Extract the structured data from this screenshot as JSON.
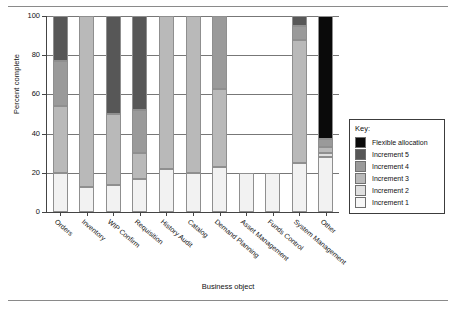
{
  "figure": {
    "rules": [
      "top-rule",
      "bottom-rule"
    ]
  },
  "chart_data": {
    "type": "bar",
    "stacked": true,
    "title": "",
    "xlabel": "Business object",
    "ylabel": "Percent complete",
    "ylim": [
      0,
      100
    ],
    "yticks": [
      0,
      20,
      40,
      60,
      80,
      100
    ],
    "grid": true,
    "legend_position": "right",
    "legend_title": "Key:",
    "categories": [
      "Orders",
      "Inventory",
      "WIP Confirm",
      "Requisition",
      "History Audit",
      "Catalog",
      "Demand Planning",
      "Asset Management",
      "Funds Control",
      "System Management",
      "Other"
    ],
    "series": [
      {
        "name": "Increment 1",
        "color": "#f2f2f2",
        "values": [
          20,
          13,
          14,
          17,
          22,
          20,
          23,
          20,
          20,
          25,
          28
        ]
      },
      {
        "name": "Increment 2",
        "color": "#e0e0e0",
        "values": [
          0,
          0,
          0,
          0,
          0,
          0,
          0,
          0,
          0,
          0,
          2
        ]
      },
      {
        "name": "Increment 3",
        "color": "#b9b9b9",
        "values": [
          34,
          87,
          36,
          13,
          78,
          80,
          40,
          0,
          0,
          63,
          3
        ]
      },
      {
        "name": "Increment 4",
        "color": "#9a9a9a",
        "values": [
          23,
          0,
          0,
          22,
          0,
          0,
          37,
          0,
          0,
          7,
          4
        ]
      },
      {
        "name": "Increment 5",
        "color": "#575757",
        "values": [
          23,
          0,
          50,
          48,
          0,
          0,
          0,
          0,
          0,
          5,
          0
        ]
      },
      {
        "name": "Flexible allocation",
        "color": "#0a0a0a",
        "values": [
          0,
          0,
          0,
          0,
          0,
          0,
          0,
          0,
          0,
          0,
          63
        ]
      }
    ],
    "legend_entries": [
      {
        "label": "Flexible allocation",
        "color": "#0a0a0a"
      },
      {
        "label": "Increment 5",
        "color": "#575757"
      },
      {
        "label": "Increment 4",
        "color": "#9a9a9a"
      },
      {
        "label": "Increment 3",
        "color": "#b9b9b9"
      },
      {
        "label": "Increment 2",
        "color": "#e0e0e0"
      },
      {
        "label": "Increment 1",
        "color": "#f7f7f7"
      }
    ]
  }
}
